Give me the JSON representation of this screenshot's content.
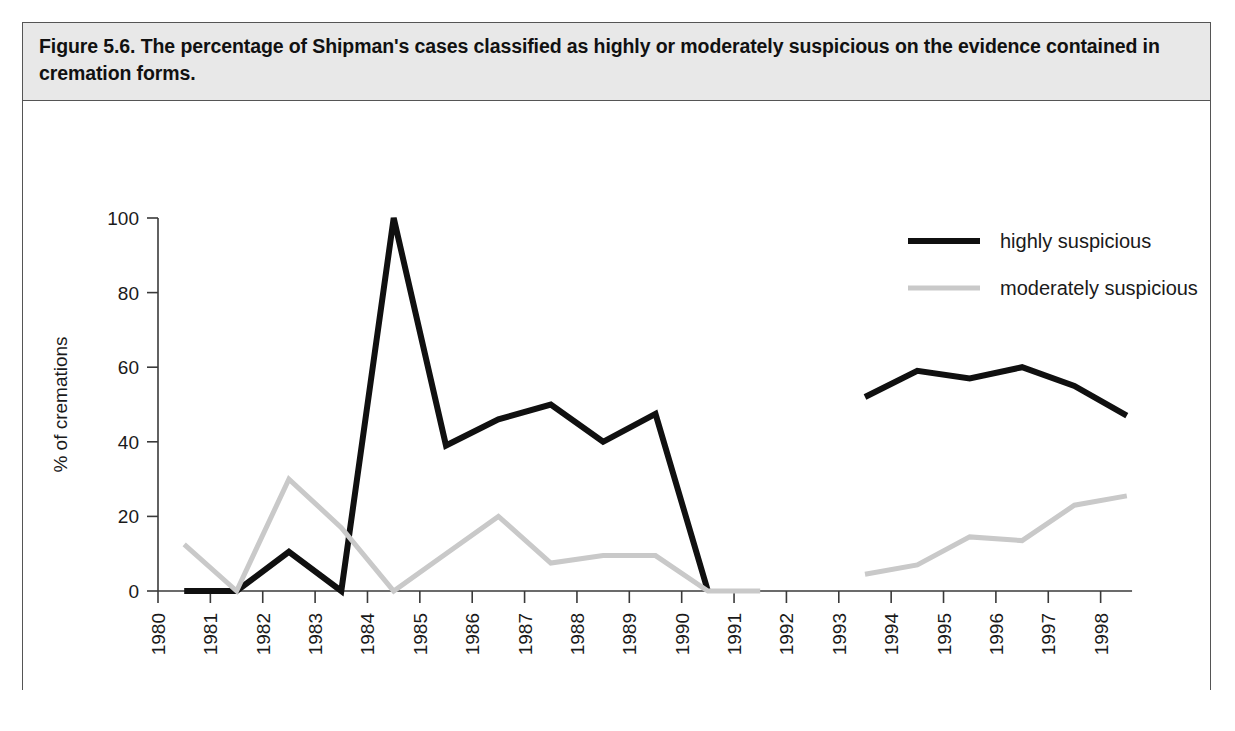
{
  "figure": {
    "caption": "Figure 5.6. The percentage of Shipman's cases classified as highly or moderately suspicious on the evidence contained in cremation forms."
  },
  "legend": {
    "position": "top-right",
    "entries": [
      {
        "label": "highly suspicious",
        "color": "#101010",
        "style": "solid-thick"
      },
      {
        "label": "moderately suspicious",
        "color": "#c9c9c9",
        "style": "solid-light"
      }
    ]
  },
  "chart_data": {
    "type": "line",
    "title": "",
    "xlabel": "year",
    "ylabel": "% of cremations",
    "xlim": [
      1980,
      1999
    ],
    "ylim": [
      0,
      100
    ],
    "yticks": [
      0,
      20,
      40,
      60,
      80,
      100
    ],
    "xticks": [
      1980,
      1981,
      1982,
      1983,
      1984,
      1985,
      1986,
      1987,
      1988,
      1989,
      1990,
      1991,
      1992,
      1993,
      1994,
      1995,
      1996,
      1997,
      1998
    ],
    "grid": false,
    "series": [
      {
        "name": "highly suspicious",
        "color": "#101010",
        "segments": [
          {
            "x": [
              1980.5,
              1981.5,
              1982.5,
              1983.5,
              1984.5,
              1985.5,
              1986.5,
              1987.5,
              1988.5,
              1989.5,
              1990.5
            ],
            "y": [
              0,
              0,
              10.5,
              0,
              100,
              39,
              46,
              50,
              40,
              47.5,
              0
            ]
          },
          {
            "x": [
              1993.5,
              1994.5,
              1995.5,
              1996.5,
              1997.5,
              1998.5
            ],
            "y": [
              52,
              59,
              57,
              60,
              55,
              47
            ]
          }
        ]
      },
      {
        "name": "moderately suspicious",
        "color": "#c9c9c9",
        "segments": [
          {
            "x": [
              1980.5,
              1981.5,
              1982.5,
              1983.5,
              1984.5,
              1985.5,
              1986.5,
              1987.5,
              1988.5,
              1989.5,
              1990.5,
              1991.5
            ],
            "y": [
              12.5,
              0,
              30,
              17,
              0,
              10,
              20,
              7.5,
              9.5,
              9.5,
              0,
              0
            ]
          },
          {
            "x": [
              1993.5,
              1994.5,
              1995.5,
              1996.5,
              1997.5,
              1998.5
            ],
            "y": [
              4.5,
              7,
              14.5,
              13.5,
              23,
              25.5
            ]
          }
        ]
      }
    ]
  }
}
